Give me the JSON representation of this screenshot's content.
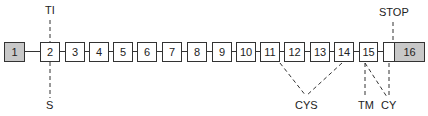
{
  "diagram": {
    "type": "exon-structure",
    "exons": [
      {
        "label": "1",
        "shaded": true
      },
      {
        "label": "2"
      },
      {
        "label": "3"
      },
      {
        "label": "4"
      },
      {
        "label": "5"
      },
      {
        "label": "6"
      },
      {
        "label": "7"
      },
      {
        "label": "8"
      },
      {
        "label": "9"
      },
      {
        "label": "10"
      },
      {
        "label": "11"
      },
      {
        "label": "12"
      },
      {
        "label": "13"
      },
      {
        "label": "14"
      },
      {
        "label": "15"
      },
      {
        "label": "16",
        "shaded": true,
        "partial_unshaded": true
      }
    ],
    "annotations": {
      "ti": "TI",
      "s": "S",
      "cys": "CYS",
      "tm": "TM",
      "cy": "CY",
      "stop": "STOP"
    }
  }
}
